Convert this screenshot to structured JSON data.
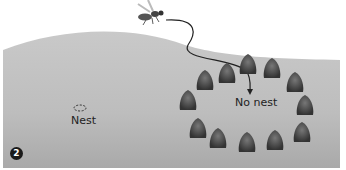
{
  "figure": {
    "step_number": "2",
    "labels": {
      "nest": "Nest",
      "no_nest": "No nest"
    },
    "icons": [
      "wasp-icon",
      "flight-path-arrow",
      "nest-marker-dashed-ellipse",
      "pinecone-icon"
    ],
    "pinecone_count": 12,
    "colors": {
      "ground": "#b9b9b9",
      "pinecone": "#4a4a4a",
      "text": "#222222",
      "badge": "#1a1a1a"
    }
  }
}
